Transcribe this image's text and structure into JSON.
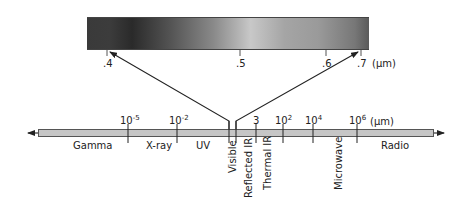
{
  "diagram": {
    "visible_detail": {
      "unit": "(µm)",
      "ticks": [
        {
          "label": ".4",
          "value": 0.4
        },
        {
          "label": ".5",
          "value": 0.5
        },
        {
          "label": ".6",
          "value": 0.6
        },
        {
          "label": ".7",
          "value": 0.7
        }
      ],
      "gradient_description": "grayscale rendering of visible spectrum from violet (.4) to red (.7)"
    },
    "main_axis": {
      "unit": "(µm)",
      "tick_labels": [
        {
          "base": "10",
          "exp": "-5"
        },
        {
          "base": "10",
          "exp": "-2"
        },
        {
          "base": "3",
          "exp": ""
        },
        {
          "base": "10",
          "exp": "2"
        },
        {
          "base": "10",
          "exp": "4"
        },
        {
          "base": "10",
          "exp": "6"
        }
      ],
      "regions_horizontal": [
        "Gamma",
        "X-ray",
        "UV",
        "Radio"
      ],
      "regions_vertical": [
        "Visible",
        "Reflected IR",
        "Thermal IR",
        "Microwave"
      ]
    },
    "colors": {
      "axis_fill": "#c6c6c6",
      "line": "#222222",
      "text": "#222222"
    }
  }
}
